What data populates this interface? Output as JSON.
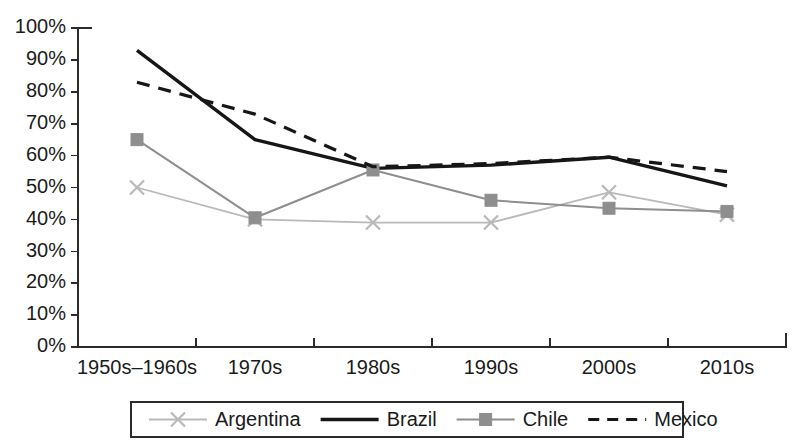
{
  "chart_data": {
    "type": "line",
    "title": "",
    "subtitle": "",
    "xlabel": "",
    "ylabel": "",
    "categories": [
      "1950s–1960s",
      "1970s",
      "1980s",
      "1990s",
      "2000s",
      "2010s"
    ],
    "ylim": [
      0,
      100
    ],
    "ytick_labels": [
      "0%",
      "10%",
      "20%",
      "30%",
      "40%",
      "50%",
      "60%",
      "70%",
      "80%",
      "90%",
      "100%"
    ],
    "ytick_values": [
      0,
      10,
      20,
      30,
      40,
      50,
      60,
      70,
      80,
      90,
      100
    ],
    "grid": false,
    "legend_position": "bottom",
    "series": [
      {
        "name": "Argentina",
        "values": [
          50,
          40,
          39,
          39,
          48.5,
          41.5
        ],
        "color": "#b9b9b9",
        "marker": "x",
        "dash": "none",
        "width": 1.8
      },
      {
        "name": "Brazil",
        "values": [
          93,
          65,
          56,
          57,
          59.5,
          50.5
        ],
        "color": "#161616",
        "marker": "none",
        "dash": "none",
        "width": 3.4
      },
      {
        "name": "Chile",
        "values": [
          65,
          40.5,
          55.5,
          46,
          43.5,
          42.5
        ],
        "color": "#8e8e8e",
        "marker": "square",
        "dash": "none",
        "width": 2.0
      },
      {
        "name": "Mexico",
        "values": [
          83,
          73,
          56.5,
          57.5,
          59.5,
          55
        ],
        "color": "#161616",
        "marker": "none",
        "dash": "dashed",
        "width": 3.2
      }
    ]
  },
  "legend": {
    "items": [
      {
        "label": "Argentina"
      },
      {
        "label": "Brazil"
      },
      {
        "label": "Chile"
      },
      {
        "label": "Mexico"
      }
    ]
  },
  "colors": {
    "axis": "#2b2b2b",
    "text": "#1a1a1a",
    "background": "#ffffff",
    "argentina": "#b9b9b9",
    "brazil": "#161616",
    "chile": "#8e8e8e",
    "mexico": "#161616"
  }
}
